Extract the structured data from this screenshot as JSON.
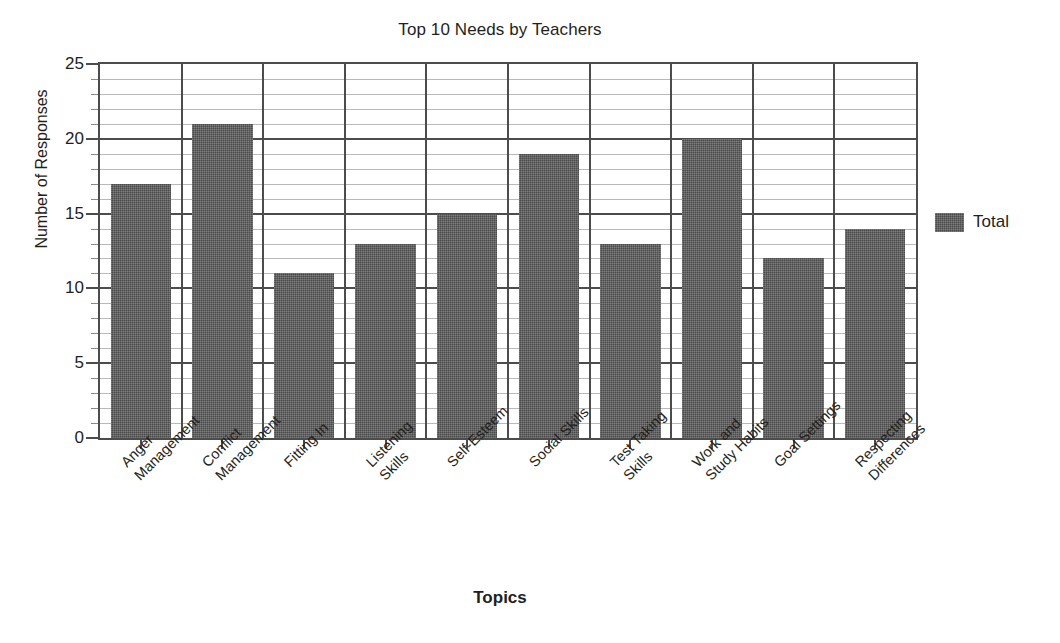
{
  "chart_data": {
    "type": "bar",
    "title": "Top 10 Needs by Teachers",
    "xlabel": "Topics",
    "ylabel": "Number of Responses",
    "categories": [
      "Anger\nManagement",
      "Conflict\nManagement",
      "Fitting In",
      "Listening\nSkills",
      "Self-Esteem",
      "Social Skills",
      "Test Taking\nSkills",
      "Work and\nStudy Habits",
      "Goal Settings",
      "Respecting\nDifferences"
    ],
    "series": [
      {
        "name": "Total",
        "values": [
          17,
          21,
          11,
          13,
          15,
          19,
          13,
          20,
          12,
          14
        ]
      }
    ],
    "ylim": [
      0,
      25
    ],
    "ytick_labels": [
      "0",
      "5",
      "10",
      "15",
      "20",
      "25"
    ],
    "ytick_values": [
      0,
      5,
      10,
      15,
      20,
      25
    ],
    "minor_tick_step": 1,
    "grid": "horizontal-major-and-minor, vertical-category-dividers",
    "legend_position": "right",
    "legend_entries": [
      "Total"
    ],
    "colors": {
      "bar": "#5d5d5d",
      "axis": "#4c4c4c",
      "minor_grid": "#b9b9b9",
      "text": "#231f20",
      "background": "#ffffff"
    }
  }
}
